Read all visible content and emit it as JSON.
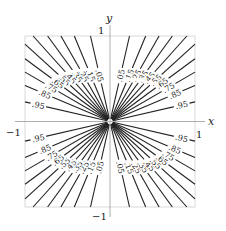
{
  "chart_data": {
    "type": "contour",
    "function": "x^2/(x^2+y^2)",
    "title": "",
    "xlabel": "x",
    "ylabel": "y",
    "xlim": [
      -1,
      1
    ],
    "ylim": [
      -1,
      1
    ],
    "xticks": [
      "-1",
      "1"
    ],
    "yticks": [
      "1",
      "-1"
    ],
    "grid": false,
    "legend": "none",
    "levels": [
      0.05,
      0.15,
      0.25,
      0.35,
      0.45,
      0.55,
      0.65,
      0.75,
      0.85,
      0.95
    ],
    "level_labels": [
      ".05",
      ".15",
      ".25",
      ".35",
      ".45",
      ".55",
      ".65",
      ".75",
      ".85",
      ".95"
    ],
    "line_color": "#222222",
    "axis_color": "#999999"
  },
  "axes": {
    "x_label": "x",
    "y_label": "y",
    "x_min_label": "−1",
    "x_max_label": "1",
    "y_max_label": "1",
    "y_min_label": "−1"
  }
}
